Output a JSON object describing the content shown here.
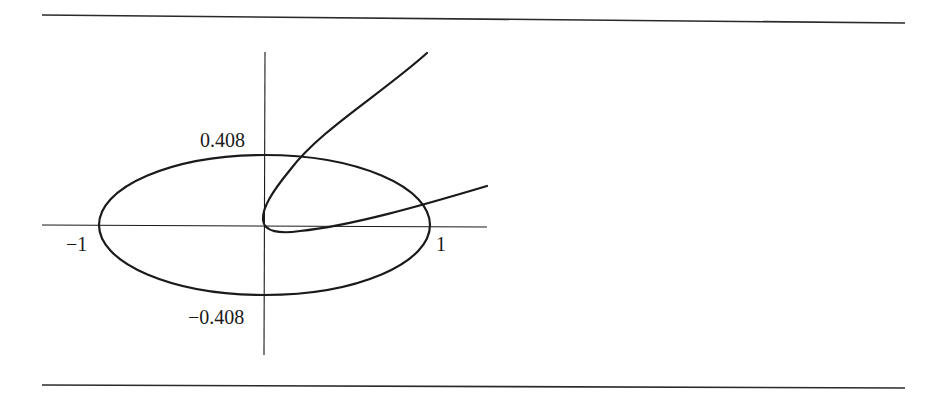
{
  "figure": {
    "type": "mathematical-plot",
    "axis_labels": {
      "y_top": "0.408",
      "y_bottom": "−0.408",
      "x_left": "−1",
      "x_right": "1"
    },
    "ellipse": {
      "semi_axis_x": 1,
      "semi_axis_y": 0.408
    },
    "colors": {
      "stroke": "#1a1a1a",
      "background": "#ffffff"
    }
  }
}
